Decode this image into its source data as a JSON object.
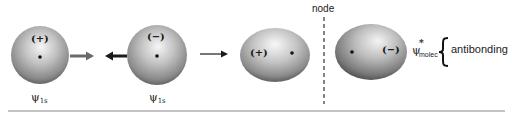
{
  "diagram": {
    "atomic_orbitals": [
      {
        "sign": "(+)",
        "label_symbol": "ψ",
        "label_sub": "1s"
      },
      {
        "sign": "(−)",
        "label_symbol": "ψ",
        "label_sub": "1s"
      }
    ],
    "molecular_orbital": {
      "left_lobe_sign": "(+)",
      "right_lobe_sign": "(−)",
      "label_symbol": "ψ",
      "label_superscript": "*",
      "label_sub": "molec",
      "bond_type": "antibonding"
    },
    "node_label": "node",
    "colors": {
      "sphere_light": "#f4f4f4",
      "sphere_mid": "#b5b5b5",
      "sphere_dark": "#6e6e6e",
      "arrow_dark": "#1a1a1a",
      "arrow_gray": "#6a6a6a",
      "rule": "#8a8a8a"
    }
  }
}
